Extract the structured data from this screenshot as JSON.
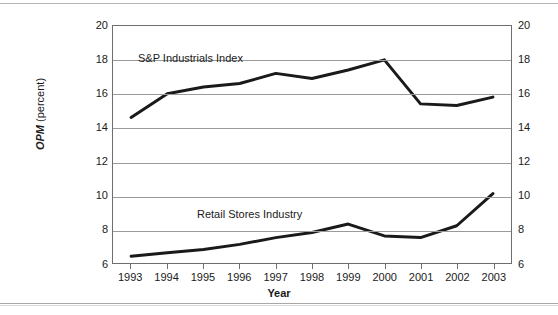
{
  "chart_data": {
    "type": "line",
    "title": "",
    "xlabel": "Year",
    "ylabel": "OPM (percent)",
    "ylabel_emphasis": "OPM",
    "ylabel_rest": " (percent)",
    "categories": [
      "1993",
      "1994",
      "1995",
      "1996",
      "1997",
      "1998",
      "1999",
      "2000",
      "2001",
      "2002",
      "2003"
    ],
    "x": [
      1993,
      1994,
      1995,
      1996,
      1997,
      1998,
      1999,
      2000,
      2001,
      2002,
      2003
    ],
    "ylim": [
      6,
      20
    ],
    "yticks": [
      6,
      8,
      10,
      12,
      14,
      16,
      18,
      20
    ],
    "yticks_left": [
      "6",
      "8",
      "10",
      "12",
      "14",
      "16",
      "18",
      "20"
    ],
    "yticks_right": [
      "6",
      "8",
      "10",
      "12",
      "14",
      "16",
      "18",
      "20"
    ],
    "grid": true,
    "grid_axis": "y",
    "legend_position": "inline-annotations",
    "series": [
      {
        "name": "S&P Industrials Index",
        "label_text": "S&P Industrials Index",
        "values": [
          14.6,
          16.0,
          16.4,
          16.6,
          17.2,
          16.9,
          17.4,
          18.0,
          15.4,
          15.3,
          15.8
        ],
        "color": "#1a1a1a",
        "line_width": 3
      },
      {
        "name": "Retail Stores Industry",
        "label_text": "Retail Stores Industry",
        "values": [
          6.4,
          6.6,
          6.8,
          7.1,
          7.5,
          7.8,
          8.3,
          7.6,
          7.5,
          8.2,
          10.1
        ],
        "color": "#1a1a1a",
        "line_width": 3
      }
    ]
  },
  "axis": {
    "x_title": "Year",
    "y_title_bold": "OPM",
    "y_title_plain": " (percent)"
  },
  "annotations": {
    "sp_label": "S&P Industrials Index",
    "retail_label": "Retail Stores Industry"
  },
  "colors": {
    "line": "#1a1a1a",
    "grid": "#9a9a9a",
    "frame": "#6e6e6e",
    "background": "#ffffff"
  }
}
